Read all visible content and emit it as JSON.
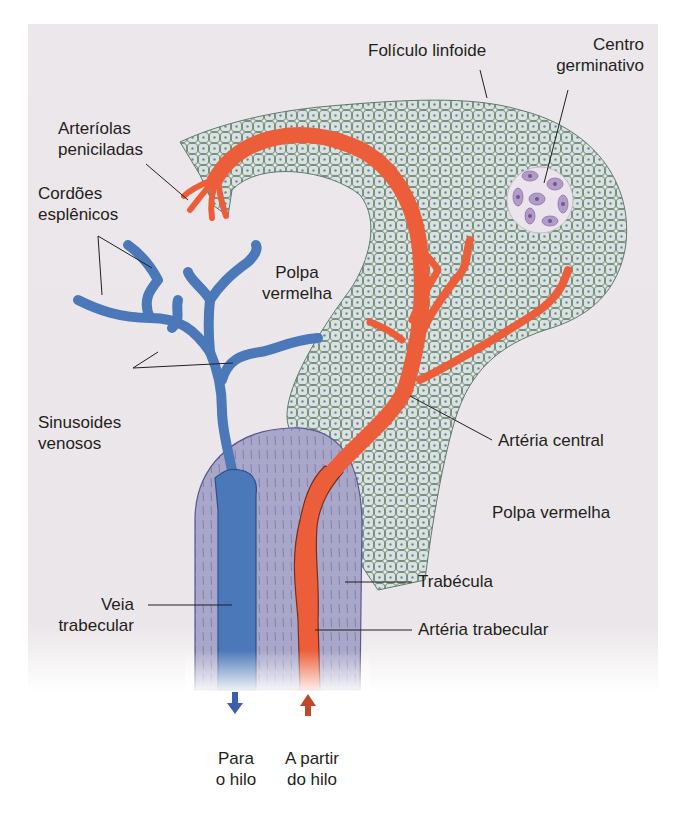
{
  "figure": {
    "colors": {
      "background": "#ebe6e9",
      "follicle_fill": "#d7e3dc",
      "follicle_cell_border": "#5e7a6d",
      "artery": "#ec5e3a",
      "vein": "#4a78b8",
      "trabecula": "#a8a6c8",
      "germinal_center": "#ece4ec",
      "germinal_cells": "#b49ac6"
    },
    "labels": {
      "foliculo": "Folículo linfoide",
      "centro_l1": "Centro",
      "centro_l2": "germinativo",
      "arteriolas_l1": "Arteríolas",
      "arteriolas_l2": "peniciladas",
      "cordoes_l1": "Cordões",
      "cordoes_l2": "esplênicos",
      "polpa_top_l1": "Polpa",
      "polpa_top_l2": "vermelha",
      "sinusoides_l1": "Sinusoides",
      "sinusoides_l2": "venosos",
      "arteria_central": "Artéria central",
      "polpa_right": "Polpa vermelha",
      "trabecula": "Trabécula",
      "veia_l1": "Veia",
      "veia_l2": "trabecular",
      "arteria_trabecular": "Artéria trabecular",
      "para_l1": "Para",
      "para_l2": "o hilo",
      "partir_l1": "A partir",
      "partir_l2": "do hilo"
    },
    "arrows": {
      "vein_arrow": "down-arrow-icon",
      "artery_arrow": "up-arrow-icon"
    }
  }
}
